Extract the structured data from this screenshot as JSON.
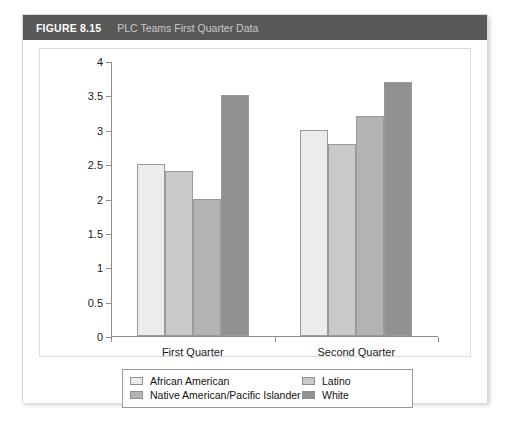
{
  "figure": {
    "label": "FIGURE 8.15",
    "caption": "PLC Teams First Quarter Data",
    "header_bg": "#585858",
    "label_color": "#ffffff",
    "caption_color": "#c9c9c9"
  },
  "chart_data": {
    "type": "bar",
    "title": "PLC Teams First Quarter Data",
    "xlabel": "",
    "ylabel": "",
    "categories": [
      "First Quarter",
      "Second Quarter"
    ],
    "series": [
      {
        "name": "African American",
        "values": [
          2.5,
          3.0
        ],
        "color": "#ececec"
      },
      {
        "name": "Latino",
        "values": [
          2.4,
          2.8
        ],
        "color": "#c9c9c9"
      },
      {
        "name": "Native American/Pacific Islander",
        "values": [
          2.0,
          3.2
        ],
        "color": "#b3b3b3"
      },
      {
        "name": "White",
        "values": [
          3.5,
          3.7
        ],
        "color": "#919191"
      }
    ],
    "ylim": [
      0,
      4
    ],
    "yticks": [
      "0",
      "0.5",
      "1",
      "1.5",
      "2",
      "2.5",
      "3",
      "3.5",
      "4"
    ],
    "ytick_values": [
      0,
      0.5,
      1,
      1.5,
      2,
      2.5,
      3,
      3.5,
      4
    ],
    "grid": false,
    "legend_position": "bottom",
    "bar_edge_color": "#9a9a9a",
    "axis_color": "#8c8c8c"
  }
}
